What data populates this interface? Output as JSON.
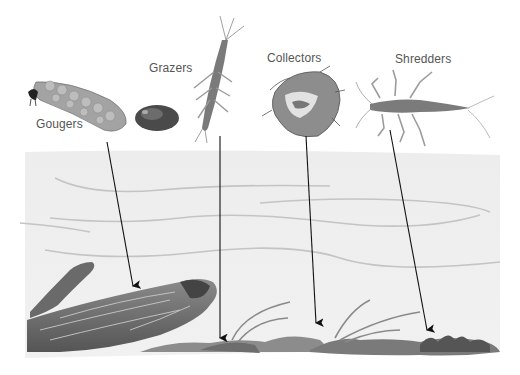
{
  "diagram": {
    "type": "illustration",
    "colors": {
      "background": "#ffffff",
      "water": "#eeeeee",
      "water_lines": "#bdbdbd",
      "arrow": "#111111",
      "label_text": "#555555",
      "log": "#6f6f6f",
      "substrate": "#7a7a7a"
    },
    "groups": [
      {
        "id": "gougers",
        "label": "Gougers",
        "organism": "cased-larva",
        "target": "submerged-log"
      },
      {
        "id": "grazers",
        "label": "Grazers",
        "organism": "snail-and-mayfly-nymph",
        "target": "rock-surface"
      },
      {
        "id": "collectors",
        "label": "Collectors",
        "organism": "net-case-larva",
        "target": "rock-sediment"
      },
      {
        "id": "shredders",
        "label": "Shredders",
        "organism": "stonefly-nymph",
        "target": "leaf-litter"
      }
    ]
  }
}
